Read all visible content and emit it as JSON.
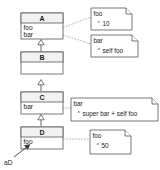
{
  "diagram": {
    "type": "uml-class-diagram",
    "colors": {
      "background": "#ffffff",
      "stroke": "#555555",
      "title_fill": "#f2f2f2",
      "body_fill": "#ffffff",
      "note_link": "#888888",
      "text": "#1a1a1a"
    },
    "classes": [
      {
        "id": "A",
        "name": "A",
        "attributes": [
          "foo",
          "bar"
        ]
      },
      {
        "id": "B",
        "name": "B",
        "attributes": [
          ""
        ]
      },
      {
        "id": "C",
        "name": "C",
        "attributes": [
          "bar"
        ]
      },
      {
        "id": "D",
        "name": "D",
        "attributes": [
          "foo"
        ]
      }
    ],
    "notes": [
      {
        "id": "note-a-foo",
        "title": "foo",
        "caret": "^",
        "body": "10",
        "attached_to": "A.foo"
      },
      {
        "id": "note-a-bar",
        "title": "bar",
        "caret": "^",
        "body": "self foo",
        "attached_to": "A.bar"
      },
      {
        "id": "note-c-bar",
        "title": "bar",
        "caret": "^",
        "body": "super bar + self foo",
        "attached_to": "C.bar"
      },
      {
        "id": "note-d-foo",
        "title": "foo",
        "caret": "^",
        "body": "50",
        "attached_to": "D.foo"
      }
    ],
    "generalizations": [
      {
        "from": "B",
        "to": "A"
      },
      {
        "from": "C",
        "to": "B"
      },
      {
        "from": "D",
        "to": "C"
      }
    ],
    "instances": [
      {
        "id": "aD",
        "label": "aD",
        "points_to": "D"
      }
    ]
  }
}
